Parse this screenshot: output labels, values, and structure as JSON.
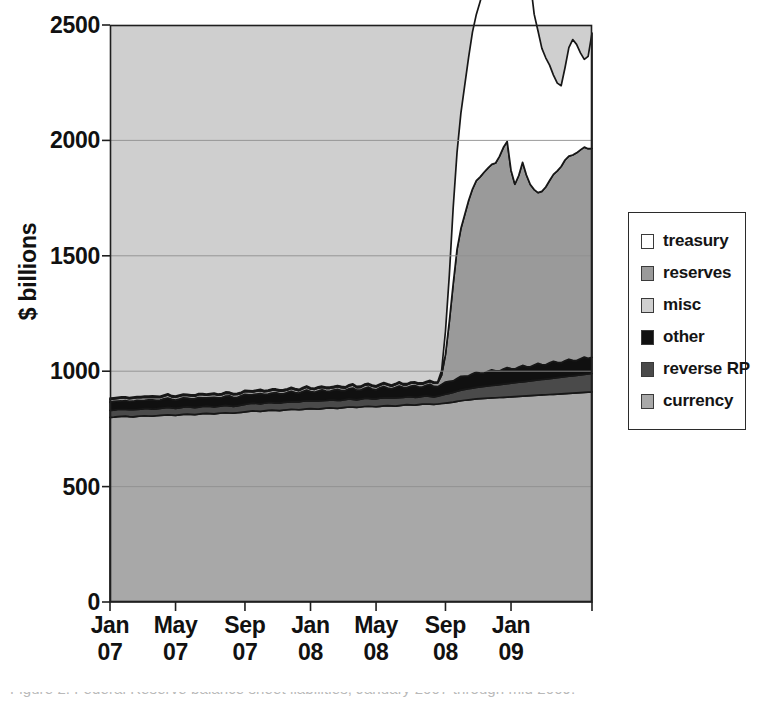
{
  "figure": {
    "y_axis_title": "$ billions",
    "caption_fragment": "Figure 2. Federal Reserve balance sheet liabilities, January 2007 through mid 2009."
  },
  "legend": {
    "position": "right",
    "items": [
      {
        "label": "treasury",
        "color": "#ffffff",
        "name": "treasury"
      },
      {
        "label": "reserves",
        "color": "#9a9a9a",
        "name": "reserves"
      },
      {
        "label": "misc",
        "color": "#cfcfcf",
        "name": "misc"
      },
      {
        "label": "other",
        "color": "#101010",
        "name": "other"
      },
      {
        "label": "reverse RP",
        "color": "#4a4a4a",
        "name": "reverse-rp"
      },
      {
        "label": "currency",
        "color": "#a8a8a8",
        "name": "currency"
      }
    ]
  },
  "chart_data": {
    "type": "area",
    "stacked": true,
    "title": "",
    "xlabel": "",
    "ylabel": "$ billions",
    "ylim": [
      0,
      2500
    ],
    "yticks": [
      0,
      500,
      1000,
      1500,
      2000,
      2500
    ],
    "grid": true,
    "grid_axis": "y",
    "plot_background": "#cfcfcf",
    "xtick_labels": [
      {
        "month": "Jan",
        "year": "07"
      },
      {
        "month": "May",
        "year": "07"
      },
      {
        "month": "Sep",
        "year": "07"
      },
      {
        "month": "Jan",
        "year": "08"
      },
      {
        "month": "May",
        "year": "08"
      },
      {
        "month": "Sep",
        "year": "08"
      },
      {
        "month": "Jan",
        "year": "09"
      }
    ],
    "xtick_index": [
      0,
      17,
      35,
      52,
      69,
      87,
      104
    ],
    "x_index_count": 126,
    "x_note": "weekly observations, index 0 = Jan 2007, index 125 = mid-2009",
    "stack_order_bottom_to_top": [
      "currency",
      "reverse RP",
      "other",
      "reserves",
      "treasury",
      "misc"
    ],
    "series": [
      {
        "name": "currency",
        "color": "#a8a8a8",
        "values": [
          800,
          801,
          803,
          804,
          805,
          803,
          802,
          804,
          806,
          807,
          806,
          805,
          807,
          809,
          810,
          811,
          810,
          809,
          811,
          813,
          814,
          813,
          812,
          814,
          816,
          817,
          816,
          815,
          817,
          819,
          820,
          819,
          818,
          820,
          822,
          824,
          826,
          828,
          827,
          826,
          828,
          830,
          831,
          830,
          829,
          831,
          833,
          835,
          834,
          833,
          835,
          837,
          838,
          837,
          836,
          838,
          840,
          841,
          840,
          839,
          841,
          843,
          845,
          844,
          843,
          845,
          847,
          848,
          847,
          846,
          848,
          850,
          851,
          850,
          849,
          851,
          853,
          855,
          854,
          853,
          855,
          857,
          858,
          857,
          856,
          858,
          860,
          862,
          864,
          866,
          869,
          872,
          874,
          876,
          878,
          880,
          881,
          882,
          883,
          884,
          885,
          886,
          887,
          888,
          889,
          890,
          891,
          892,
          893,
          894,
          895,
          896,
          897,
          898,
          899,
          900,
          901,
          902,
          903,
          904,
          905,
          906,
          907,
          908,
          909,
          910
        ]
      },
      {
        "name": "reverse RP",
        "color": "#4a4a4a",
        "values": [
          30,
          30,
          31,
          30,
          29,
          30,
          31,
          30,
          30,
          31,
          32,
          31,
          30,
          30,
          31,
          32,
          31,
          30,
          30,
          31,
          32,
          31,
          30,
          30,
          31,
          32,
          31,
          30,
          30,
          31,
          32,
          31,
          30,
          30,
          31,
          32,
          33,
          34,
          33,
          32,
          33,
          34,
          33,
          32,
          33,
          34,
          33,
          32,
          33,
          34,
          35,
          34,
          33,
          34,
          35,
          34,
          33,
          34,
          35,
          34,
          33,
          34,
          35,
          34,
          33,
          34,
          35,
          34,
          33,
          34,
          35,
          34,
          33,
          34,
          35,
          34,
          33,
          34,
          35,
          34,
          33,
          34,
          35,
          34,
          33,
          34,
          36,
          38,
          40,
          42,
          44,
          46,
          47,
          48,
          49,
          50,
          51,
          52,
          53,
          54,
          55,
          56,
          57,
          58,
          59,
          60,
          61,
          62,
          63,
          64,
          65,
          66,
          67,
          68,
          69,
          70,
          71,
          72,
          73,
          74,
          75,
          76,
          77,
          78,
          79,
          80
        ]
      },
      {
        "name": "other",
        "color": "#101010",
        "values": [
          36,
          38,
          36,
          37,
          39,
          36,
          37,
          40,
          37,
          36,
          38,
          40,
          37,
          36,
          39,
          41,
          37,
          36,
          38,
          41,
          37,
          36,
          39,
          42,
          38,
          36,
          39,
          42,
          38,
          36,
          40,
          43,
          38,
          36,
          40,
          44,
          39,
          37,
          41,
          45,
          39,
          37,
          41,
          45,
          40,
          37,
          42,
          46,
          40,
          38,
          42,
          47,
          41,
          38,
          43,
          47,
          41,
          38,
          43,
          48,
          42,
          39,
          44,
          49,
          42,
          39,
          44,
          49,
          43,
          39,
          45,
          50,
          43,
          40,
          45,
          51,
          44,
          40,
          46,
          51,
          44,
          40,
          46,
          52,
          45,
          41,
          47,
          53,
          52,
          50,
          55,
          60,
          58,
          56,
          62,
          66,
          60,
          58,
          64,
          68,
          62,
          59,
          65,
          70,
          63,
          60,
          66,
          71,
          64,
          61,
          67,
          72,
          65,
          62,
          68,
          73,
          66,
          63,
          69,
          74,
          67,
          64,
          70,
          75,
          68,
          70
        ]
      },
      {
        "name": "reserves",
        "color": "#9a9a9a",
        "values": [
          12,
          11,
          12,
          13,
          11,
          12,
          13,
          11,
          12,
          13,
          11,
          12,
          13,
          11,
          12,
          13,
          11,
          12,
          13,
          11,
          12,
          13,
          11,
          12,
          13,
          11,
          12,
          13,
          11,
          12,
          13,
          11,
          12,
          13,
          11,
          12,
          13,
          11,
          12,
          13,
          11,
          12,
          13,
          11,
          12,
          13,
          11,
          12,
          13,
          11,
          12,
          13,
          11,
          12,
          13,
          11,
          12,
          13,
          11,
          12,
          13,
          11,
          12,
          13,
          11,
          12,
          13,
          11,
          12,
          13,
          11,
          12,
          13,
          11,
          12,
          13,
          11,
          12,
          13,
          11,
          12,
          13,
          11,
          12,
          14,
          16,
          40,
          120,
          260,
          420,
          560,
          640,
          700,
          760,
          800,
          830,
          850,
          870,
          880,
          890,
          900,
          930,
          960,
          980,
          860,
          800,
          830,
          880,
          830,
          790,
          760,
          740,
          750,
          770,
          790,
          810,
          830,
          850,
          870,
          880,
          890,
          900,
          905,
          910,
          908,
          905
        ]
      },
      {
        "name": "treasury",
        "color": "#ffffff",
        "values": [
          5,
          5,
          5,
          5,
          5,
          5,
          5,
          5,
          5,
          5,
          5,
          5,
          5,
          5,
          5,
          5,
          5,
          5,
          5,
          5,
          5,
          5,
          5,
          5,
          5,
          5,
          5,
          5,
          5,
          5,
          5,
          5,
          5,
          5,
          5,
          5,
          5,
          5,
          5,
          5,
          5,
          5,
          5,
          5,
          5,
          5,
          5,
          5,
          5,
          5,
          5,
          5,
          5,
          5,
          5,
          5,
          5,
          5,
          5,
          5,
          5,
          5,
          5,
          5,
          5,
          5,
          5,
          5,
          5,
          5,
          5,
          5,
          5,
          5,
          5,
          5,
          5,
          5,
          5,
          5,
          5,
          5,
          5,
          5,
          5,
          5,
          20,
          100,
          200,
          330,
          420,
          500,
          560,
          620,
          680,
          720,
          760,
          800,
          840,
          880,
          930,
          1000,
          1090,
          1120,
          1130,
          1180,
          1200,
          1150,
          1010,
          880,
          760,
          700,
          620,
          560,
          500,
          430,
          380,
          350,
          400,
          470,
          500,
          470,
          420,
          380,
          400,
          500,
          620,
          760,
          880
        ]
      }
    ],
    "series_notes": {
      "treasury": "Treasury supplementary financing account; near zero until Sep 2008, spikes to ~1180 then declines",
      "reserves": "Bank reserve balances; near zero until Sep 2008, rises sharply to ~900",
      "misc": "Remaining area to top of plot (background), not a bounded series",
      "other": "Thin dark band, ~36-75",
      "reverse RP": "Reverse repurchase agreements, ~30-80",
      "currency": "Currency in circulation, ~800-910"
    },
    "annotations": [
      {
        "text": "Total peaks near 2330 in late 2008",
        "value": 2330
      },
      {
        "text": "Pre-crisis total roughly 880-900",
        "value": 890
      }
    ]
  }
}
